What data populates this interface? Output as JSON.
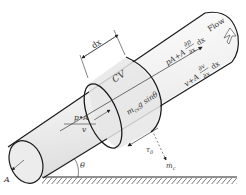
{
  "diagram": {
    "labels": {
      "flow": "Flow",
      "dx_top": "dx",
      "cv": "CV",
      "pA_out": "pA+A",
      "dp_num": "∂p",
      "dp_den": "∂x",
      "dx_p": "dx",
      "v_out": "v+A",
      "dv_num": "∂v",
      "dv_den": "∂x",
      "dx_v": "dx",
      "pA_in": "p•A",
      "v_in": "v",
      "weight": "m",
      "weight_sub": "cv",
      "weight_rest": "g sinθ",
      "shear": "τ",
      "shear_sub": "0",
      "mass_flux": "ṁ",
      "mass_flux_sub": "c",
      "angle": "θ",
      "area": "A"
    },
    "colors": {
      "stroke": "#1a1a1a",
      "pipe_fill": "#f2f2f2",
      "cv_fill": "#e4e4e4",
      "text": "#333333"
    }
  }
}
